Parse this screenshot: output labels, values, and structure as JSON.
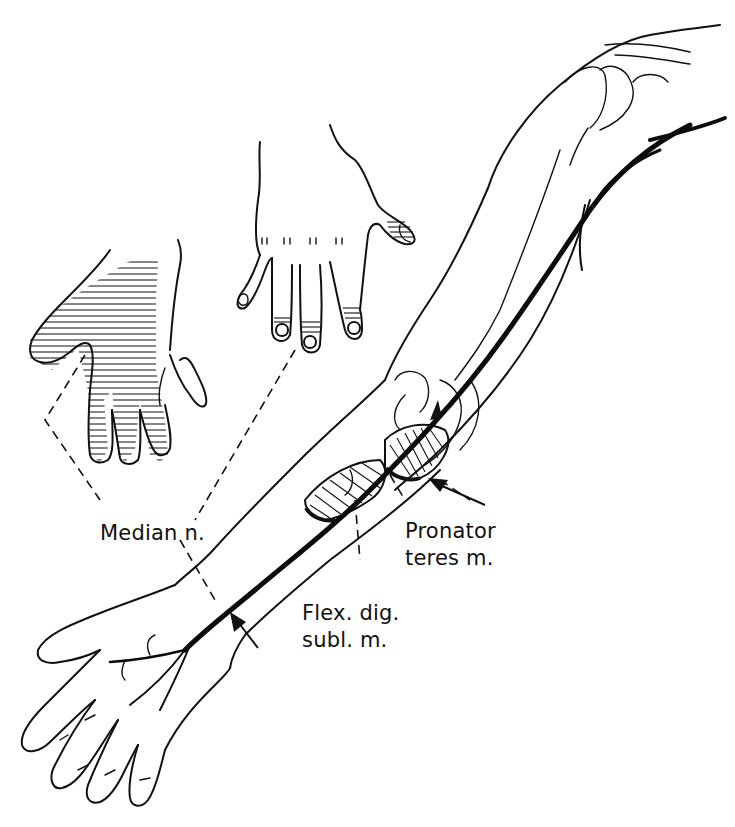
{
  "figure": {
    "background_color": "#ffffff",
    "ink_color": "#111111"
  },
  "labels": {
    "median_nerve": "Median n.",
    "pronator_teres": {
      "line1": "Pronator",
      "line2": "teres m."
    },
    "flexor_digitorum": {
      "line1": "Flex. dig.",
      "line2": "subl. m."
    }
  },
  "insets": [
    {
      "name": "palmar-hand",
      "description": "Palm view with hatched sensory area over thumb, index, middle and radial half of ring finger"
    },
    {
      "name": "dorsal-hand",
      "description": "Dorsal view with hatched fingertips of index, middle, ring and thumb tip"
    }
  ],
  "arrows": [
    {
      "name": "pronator-arrow",
      "points_to": "pronator teres compression site"
    },
    {
      "name": "wrist-arrow",
      "points_to": "median nerve at forearm/wrist"
    }
  ]
}
